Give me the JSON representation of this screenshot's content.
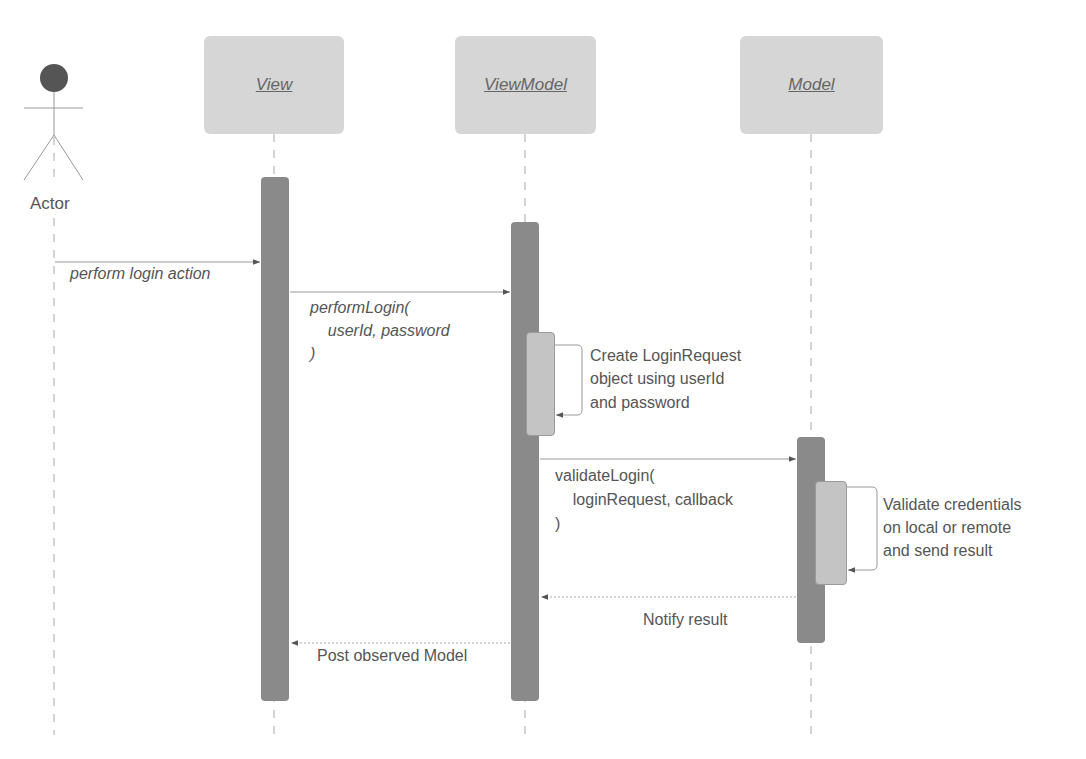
{
  "diagram": {
    "type": "UML sequence diagram",
    "colors": {
      "participant_fill": "#d6d6d6",
      "activation_fill": "#8a8a8a",
      "nested_activation_fill": "#c4c4c4",
      "line": "#999999",
      "text": "#555555",
      "actor_head": "#555555"
    },
    "actor": {
      "label": "Actor",
      "icon": "stick-figure-icon"
    },
    "participants": [
      {
        "id": "view",
        "label": "View"
      },
      {
        "id": "viewmodel",
        "label": "ViewModel"
      },
      {
        "id": "model",
        "label": "Model"
      }
    ],
    "messages": [
      {
        "from": "Actor",
        "to": "View",
        "kind": "sync",
        "label": "perform login action"
      },
      {
        "from": "View",
        "to": "ViewModel",
        "kind": "sync",
        "label_lines": [
          "performLogin(",
          "    userId, password",
          ")"
        ]
      },
      {
        "from": "ViewModel",
        "to": "ViewModel",
        "kind": "self",
        "label_lines": [
          "Create LoginRequest",
          "object using userId",
          "and password"
        ]
      },
      {
        "from": "ViewModel",
        "to": "Model",
        "kind": "sync",
        "label_lines": [
          "validateLogin(",
          "    loginRequest, callback",
          ")"
        ]
      },
      {
        "from": "Model",
        "to": "Model",
        "kind": "self",
        "label_lines": [
          "Validate credentials",
          "on local or remote",
          "and send result"
        ]
      },
      {
        "from": "Model",
        "to": "ViewModel",
        "kind": "return",
        "label": "Notify result"
      },
      {
        "from": "ViewModel",
        "to": "View",
        "kind": "return",
        "label": "Post observed Model"
      }
    ]
  }
}
